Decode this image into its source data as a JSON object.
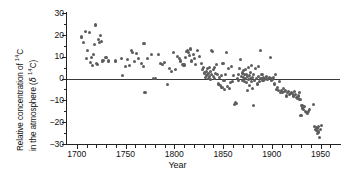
{
  "axes": {
    "ylabel_line1": "Relative concentration of ",
    "ylabel_line1_sup": "14",
    "ylabel_line1_tail": "C",
    "ylabel_line2_pre": "in the atmosphere (",
    "ylabel_line2_delta": "δ ",
    "ylabel_line2_sup": "14",
    "ylabel_line2_tail": "C)",
    "xlabel": "Year",
    "ytick_labels": [
      "30",
      "20",
      "10",
      "0",
      "−10",
      "−20",
      "−30"
    ],
    "xtick_labels": [
      "1700",
      "1750",
      "1800",
      "1850",
      "1900",
      "1950"
    ]
  },
  "chart_data": {
    "type": "scatter",
    "title": "",
    "xlabel": "Year",
    "ylabel": "Relative concentration of 14C in the atmosphere (δ 14C)",
    "xlim": [
      1690,
      1970
    ],
    "ylim": [
      -30,
      30
    ],
    "xticks": [
      1700,
      1750,
      1800,
      1850,
      1900,
      1950
    ],
    "yticks": [
      30,
      20,
      10,
      0,
      -10,
      -20,
      -30
    ],
    "minor_tick_interval_x": 10,
    "minor_tick_interval_y": 5,
    "grid": false,
    "legend": null,
    "reference_lines": [
      {
        "axis": "y",
        "value": 0,
        "color": "#3a3a3a"
      }
    ],
    "marker": {
      "shape": "circle",
      "color": "#5d5d5d",
      "size_px": 3.1
    },
    "series": [
      {
        "name": "δ 14C",
        "points": [
          [
            1705,
            19.0
          ],
          [
            1707,
            16.5
          ],
          [
            1709,
            21.5
          ],
          [
            1710,
            9.3
          ],
          [
            1711,
            12.8
          ],
          [
            1713,
            21.0
          ],
          [
            1714,
            7.5
          ],
          [
            1715,
            9.8
          ],
          [
            1716,
            6.0
          ],
          [
            1717,
            11.0
          ],
          [
            1718,
            15.5
          ],
          [
            1719,
            24.5
          ],
          [
            1720,
            7.0
          ],
          [
            1721,
            6.6
          ],
          [
            1722,
            18.0
          ],
          [
            1723,
            16.3
          ],
          [
            1724,
            19.5
          ],
          [
            1725,
            17.0
          ],
          [
            1726,
            8.0
          ],
          [
            1727,
            8.4
          ],
          [
            1730,
            9.5
          ],
          [
            1733,
            8.0
          ],
          [
            1740,
            8.0
          ],
          [
            1746,
            9.0
          ],
          [
            1747,
            1.2
          ],
          [
            1750,
            5.4
          ],
          [
            1752,
            8.5
          ],
          [
            1754,
            6.0
          ],
          [
            1756,
            13.0
          ],
          [
            1757,
            12.0
          ],
          [
            1759,
            7.7
          ],
          [
            1761,
            11.5
          ],
          [
            1763,
            9.3
          ],
          [
            1766,
            7.0
          ],
          [
            1768,
            5.3
          ],
          [
            1769,
            16.0
          ],
          [
            1770,
            -6.5
          ],
          [
            1773,
            9.3
          ],
          [
            1777,
            11.0
          ],
          [
            1779,
            0.2
          ],
          [
            1781,
            0.0
          ],
          [
            1784,
            11.0
          ],
          [
            1786,
            7.0
          ],
          [
            1788,
            6.6
          ],
          [
            1790,
            7.5
          ],
          [
            1793,
            -2.8
          ],
          [
            1795,
            4.5
          ],
          [
            1797,
            3.2
          ],
          [
            1799,
            12.0
          ],
          [
            1801,
            4.0
          ],
          [
            1803,
            10.2
          ],
          [
            1805,
            9.0
          ],
          [
            1806,
            8.0
          ],
          [
            1808,
            6.5
          ],
          [
            1810,
            6.2
          ],
          [
            1812,
            9.5
          ],
          [
            1813,
            12.5
          ],
          [
            1814,
            13.0
          ],
          [
            1815,
            12.0
          ],
          [
            1816,
            10.5
          ],
          [
            1817,
            13.5
          ],
          [
            1818,
            8.0
          ],
          [
            1820,
            11.0
          ],
          [
            1821,
            9.0
          ],
          [
            1822,
            6.5
          ],
          [
            1824,
            13.0
          ],
          [
            1826,
            10.0
          ],
          [
            1828,
            6.8
          ],
          [
            1829,
            4.0
          ],
          [
            1830,
            5.0
          ],
          [
            1831,
            2.5
          ],
          [
            1832,
            0.5
          ],
          [
            1833,
            1.2
          ],
          [
            1833,
            3.0
          ],
          [
            1834,
            4.5
          ],
          [
            1834,
            2.0
          ],
          [
            1835,
            0.0
          ],
          [
            1835,
            2.2
          ],
          [
            1836,
            5.0
          ],
          [
            1836,
            1.0
          ],
          [
            1837,
            3.4
          ],
          [
            1837,
            -0.5
          ],
          [
            1838,
            13.0
          ],
          [
            1838,
            2.0
          ],
          [
            1839,
            12.5
          ],
          [
            1840,
            4.0
          ],
          [
            1840,
            1.0
          ],
          [
            1841,
            5.0
          ],
          [
            1841,
            0.0
          ],
          [
            1842,
            2.4
          ],
          [
            1843,
            6.5
          ],
          [
            1844,
            2.0
          ],
          [
            1845,
            -2.5
          ],
          [
            1846,
            0.6
          ],
          [
            1847,
            -3.0
          ],
          [
            1848,
            1.5
          ],
          [
            1849,
            -4.0
          ],
          [
            1850,
            7.0
          ],
          [
            1851,
            -1.0
          ],
          [
            1852,
            -5.0
          ],
          [
            1853,
            2.0
          ],
          [
            1854,
            12.0
          ],
          [
            1855,
            -3.5
          ],
          [
            1856,
            4.5
          ],
          [
            1857,
            -4.6
          ],
          [
            1858,
            -2.0
          ],
          [
            1859,
            5.5
          ],
          [
            1860,
            -1.5
          ],
          [
            1861,
            1.5
          ],
          [
            1862,
            -12.0
          ],
          [
            1863,
            -11.0
          ],
          [
            1864,
            -11.5
          ],
          [
            1865,
            0.0
          ],
          [
            1866,
            2.0
          ],
          [
            1866,
            -1.0
          ],
          [
            1867,
            4.5
          ],
          [
            1868,
            8.5
          ],
          [
            1869,
            1.0
          ],
          [
            1870,
            2.5
          ],
          [
            1870,
            -0.8
          ],
          [
            1871,
            0.5
          ],
          [
            1871,
            3.5
          ],
          [
            1872,
            -1.5
          ],
          [
            1872,
            1.8
          ],
          [
            1873,
            0.0
          ],
          [
            1873,
            4.0
          ],
          [
            1874,
            -2.0
          ],
          [
            1874,
            2.0
          ],
          [
            1875,
            0.8
          ],
          [
            1875,
            -5.5
          ],
          [
            1876,
            5.0
          ],
          [
            1876,
            -0.5
          ],
          [
            1877,
            1.5
          ],
          [
            1877,
            -3.0
          ],
          [
            1878,
            0.0
          ],
          [
            1878,
            2.8
          ],
          [
            1879,
            -1.2
          ],
          [
            1879,
            6.0
          ],
          [
            1880,
            0.5
          ],
          [
            1880,
            -4.5
          ],
          [
            1881,
            2.0
          ],
          [
            1881,
            -12.5
          ],
          [
            1882,
            -1.0
          ],
          [
            1883,
            4.5
          ],
          [
            1884,
            0.0
          ],
          [
            1885,
            -2.5
          ],
          [
            1886,
            1.0
          ],
          [
            1886,
            5.5
          ],
          [
            1887,
            -1.5
          ],
          [
            1888,
            13.0
          ],
          [
            1889,
            0.0
          ],
          [
            1890,
            2.0
          ],
          [
            1891,
            -1.0
          ],
          [
            1892,
            0.5
          ],
          [
            1893,
            -0.5
          ],
          [
            1894,
            0.0
          ],
          [
            1895,
            1.0
          ],
          [
            1896,
            -0.5
          ],
          [
            1897,
            0.0
          ],
          [
            1898,
            0.5
          ],
          [
            1899,
            9.5
          ],
          [
            1900,
            0.0
          ],
          [
            1900,
            -1.0
          ],
          [
            1901,
            -0.5
          ],
          [
            1902,
            0.5
          ],
          [
            1903,
            -2.5
          ],
          [
            1904,
            2.0
          ],
          [
            1905,
            -5.0
          ],
          [
            1906,
            -4.0
          ],
          [
            1907,
            -5.5
          ],
          [
            1908,
            -1.5
          ],
          [
            1909,
            -6.5
          ],
          [
            1910,
            -5.5
          ],
          [
            1911,
            -6.5
          ],
          [
            1912,
            -4.5
          ],
          [
            1913,
            -6.0
          ],
          [
            1914,
            -5.5
          ],
          [
            1915,
            -8.0
          ],
          [
            1916,
            -6.5
          ],
          [
            1917,
            -6.0
          ],
          [
            1918,
            -7.5
          ],
          [
            1919,
            -7.0
          ],
          [
            1920,
            -6.5
          ],
          [
            1921,
            -7.0
          ],
          [
            1922,
            -8.0
          ],
          [
            1923,
            -6.0
          ],
          [
            1924,
            -7.5
          ],
          [
            1925,
            -8.5
          ],
          [
            1926,
            -9.0
          ],
          [
            1927,
            -8.0
          ],
          [
            1928,
            -6.5
          ],
          [
            1929,
            -9.5
          ],
          [
            1930,
            -17.0
          ],
          [
            1931,
            -12.5
          ],
          [
            1932,
            -13.5
          ],
          [
            1933,
            -14.0
          ],
          [
            1934,
            -13.0
          ],
          [
            1935,
            -15.0
          ],
          [
            1936,
            -15.5
          ],
          [
            1937,
            -16.0
          ],
          [
            1938,
            -15.0
          ],
          [
            1939,
            -14.0
          ],
          [
            1943,
            -12.0
          ],
          [
            1944,
            -22.0
          ],
          [
            1945,
            -23.5
          ],
          [
            1946,
            -24.0
          ],
          [
            1946,
            -22.5
          ],
          [
            1947,
            -25.0
          ],
          [
            1947,
            -23.0
          ],
          [
            1948,
            -24.5
          ],
          [
            1948,
            -22.0
          ],
          [
            1949,
            -27.0
          ],
          [
            1950,
            -23.5
          ],
          [
            1951,
            -21.5
          ]
        ]
      }
    ]
  }
}
